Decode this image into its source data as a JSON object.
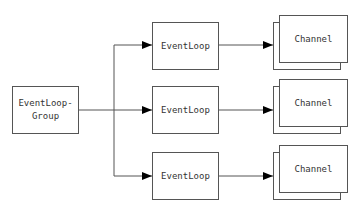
{
  "diagram": {
    "group": {
      "label_line1": "EventLoop-",
      "label_line2": "Group"
    },
    "event_loops": [
      {
        "label": "EventLoop"
      },
      {
        "label": "EventLoop"
      },
      {
        "label": "EventLoop"
      }
    ],
    "channels": [
      {
        "label": "Channel"
      },
      {
        "label": "Channel"
      },
      {
        "label": "Channel"
      }
    ],
    "colors": {
      "stroke": "#555555",
      "arrow": "#000000",
      "text": "#333333"
    }
  }
}
